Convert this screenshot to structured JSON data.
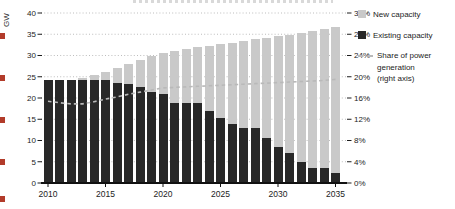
{
  "chart_data": {
    "type": "bar",
    "title": "",
    "x_years": [
      2010,
      2011,
      2012,
      2013,
      2014,
      2015,
      2016,
      2017,
      2018,
      2019,
      2020,
      2021,
      2022,
      2023,
      2024,
      2025,
      2026,
      2027,
      2028,
      2029,
      2030,
      2031,
      2032,
      2033,
      2034,
      2035
    ],
    "x_tick_labels": [
      "2010",
      "2015",
      "2020",
      "2025",
      "2030",
      "2035"
    ],
    "left_axis": {
      "unit": "GW",
      "min": 0,
      "max": 40,
      "tick_step": 5,
      "tick_labels": [
        "40",
        "35",
        "30",
        "25",
        "20",
        "15",
        "10",
        "5",
        "0"
      ]
    },
    "right_axis": {
      "min": 0,
      "max": 32,
      "tick_step": 4,
      "tick_labels": [
        "32%",
        "28%",
        "24%",
        "20%",
        "16%",
        "12%",
        "8%",
        "4%",
        "0%"
      ]
    },
    "grid": {
      "horizontal": "dotted"
    },
    "legend_position": "top-right",
    "series": [
      {
        "name": "New capacity",
        "type": "bar",
        "stack": "capacity",
        "color": "#c9c9c9",
        "values": [
          0,
          0,
          0,
          0.5,
          1.1,
          1.9,
          3.5,
          4.5,
          6.5,
          8.4,
          9.5,
          12.2,
          12.7,
          13.1,
          15.4,
          17.4,
          19.2,
          20.4,
          20.9,
          23.6,
          26.2,
          27.9,
          30.4,
          32.3,
          32.7,
          34.4
        ]
      },
      {
        "name": "Existing capacity",
        "type": "bar",
        "stack": "capacity",
        "color": "#282828",
        "values": [
          24.2,
          24.2,
          24.2,
          24.2,
          24.2,
          24.2,
          23.6,
          23.4,
          22.5,
          21.5,
          21.0,
          18.9,
          18.9,
          18.9,
          16.9,
          15.3,
          13.8,
          13.0,
          13.0,
          10.6,
          8.4,
          7.0,
          5.0,
          3.5,
          3.5,
          2.4
        ]
      },
      {
        "name": "Share of power generation (right axis)",
        "type": "dashed-line",
        "axis": "right",
        "color": "#b9b9b9",
        "values": [
          15.4,
          15.1,
          14.9,
          14.9,
          15.3,
          15.8,
          16.2,
          16.7,
          17.1,
          17.5,
          17.9,
          18.0,
          18.1,
          18.2,
          18.3,
          18.4,
          18.5,
          18.6,
          18.7,
          18.8,
          18.9,
          19.0,
          19.1,
          19.2,
          19.3,
          19.5
        ]
      }
    ]
  },
  "axis_label_gw": "GW",
  "legend": {
    "items": [
      {
        "label": "New capacity",
        "swatch": "light-gray-square"
      },
      {
        "label": "Existing capacity",
        "swatch": "dark-square"
      },
      {
        "label": "Share of power generation (right axis)",
        "swatch": "dashed-line",
        "label_lines": [
          "Share of power",
          "generation",
          "(right axis)"
        ]
      }
    ]
  },
  "page_artifacts": {
    "left_edge_mark_color": "#b23b2a",
    "left_edge_mark_count": 5,
    "cropped_title_visible": true
  }
}
